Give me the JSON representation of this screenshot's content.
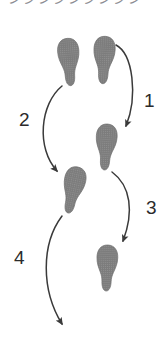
{
  "figure": {
    "type": "footstep-sequence-diagram",
    "background_color": "#ffffff",
    "width": 165,
    "height": 363,
    "cropped_top_text": "ンシンシンシンシン"
  },
  "colors": {
    "footprint_fill": "#7c7c7c",
    "footprint_edge": "#6a6a6a",
    "arrow_stroke": "#3a3a3a",
    "number_text": "#2b2b2b",
    "cut_text": "#8d8d93"
  },
  "footprints": [
    {
      "id": "footprint-1",
      "side": "left",
      "label": "left foot start",
      "x": 69,
      "y": 62,
      "rotation": -4
    },
    {
      "id": "footprint-2",
      "side": "right",
      "label": "right foot start",
      "x": 104,
      "y": 60,
      "rotation": 3
    },
    {
      "id": "footprint-3",
      "side": "right",
      "label": "right foot step one",
      "x": 106,
      "y": 147,
      "rotation": 4
    },
    {
      "id": "footprint-4",
      "side": "left",
      "label": "left foot step two",
      "x": 73,
      "y": 190,
      "rotation": 12
    },
    {
      "id": "footprint-5",
      "side": "right",
      "label": "right foot step three",
      "x": 107,
      "y": 268,
      "rotation": 2
    }
  ],
  "arrows": [
    {
      "id": "arrow-1",
      "number": "1",
      "from": "footprint-2",
      "to": "footprint-3",
      "bulge": "right",
      "number_x": 144,
      "number_y": 91
    },
    {
      "id": "arrow-2",
      "number": "2",
      "from": "footprint-1",
      "to": "footprint-4",
      "bulge": "left",
      "number_x": 19,
      "number_y": 110
    },
    {
      "id": "arrow-3",
      "number": "3",
      "from": "footprint-3",
      "to": "footprint-5",
      "bulge": "right",
      "number_x": 146,
      "number_y": 198
    },
    {
      "id": "arrow-4",
      "number": "4",
      "from": "footprint-4",
      "to": "open-end",
      "bulge": "left",
      "number_x": 14,
      "number_y": 248
    }
  ]
}
